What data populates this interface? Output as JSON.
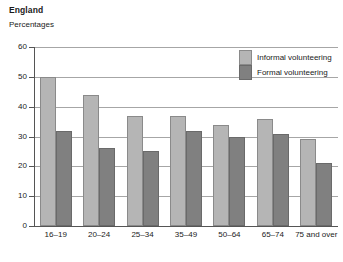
{
  "header": {
    "title": "England",
    "subtitle": "Percentages"
  },
  "legend": {
    "position": "top-right",
    "items": [
      {
        "label": "Informal volunteering",
        "color": "#b5b5b5",
        "key": "informal"
      },
      {
        "label": "Formal volunteering",
        "color": "#808080",
        "key": "formal"
      }
    ]
  },
  "axis": {
    "y_ticks": [
      "0",
      "10",
      "20",
      "30",
      "40",
      "50",
      "60"
    ],
    "x_categories": [
      "16–19",
      "20–24",
      "25–34",
      "35–49",
      "50–64",
      "65–74",
      "75 and over"
    ]
  },
  "chart_data": {
    "type": "bar",
    "title": "England",
    "subtitle": "Percentages",
    "xlabel": "",
    "ylabel": "Percentages",
    "ylim": [
      0,
      60
    ],
    "ytick_step": 10,
    "grid": true,
    "legend_position": "top-right",
    "categories": [
      "16–19",
      "20–24",
      "25–34",
      "35–49",
      "50–64",
      "65–74",
      "75 and over"
    ],
    "series": [
      {
        "name": "Informal volunteering",
        "color": "#b5b5b5",
        "values": [
          50,
          44,
          37,
          37,
          34,
          36,
          29
        ]
      },
      {
        "name": "Formal volunteering",
        "color": "#808080",
        "values": [
          32,
          26,
          25,
          32,
          30,
          31,
          21
        ]
      }
    ]
  }
}
